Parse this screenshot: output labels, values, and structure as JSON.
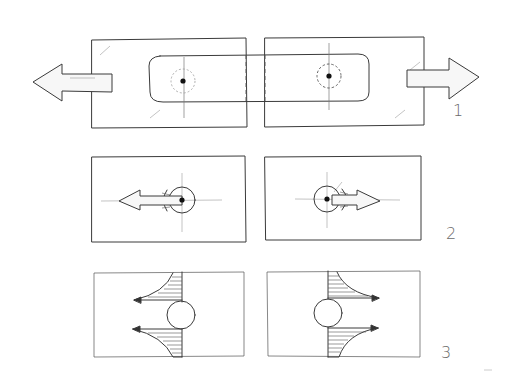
{
  "diagram": {
    "type": "hand-drawn mechanical sketch",
    "rows": [
      {
        "label": "1",
        "description": "Two plates joined by a rounded strap with two pins, pulled apart by opposing arrows"
      },
      {
        "label": "2",
        "description": "Pin in hole with bearing stress under opposite directional loads"
      },
      {
        "label": "3",
        "description": "Stress distribution at hole edges on both plates"
      }
    ]
  },
  "labels": {
    "row1": "1",
    "row2": "2",
    "row3": "3"
  },
  "colors": {
    "line": "#3a3a3a",
    "faint": "#9a9a9a",
    "pin": "#111111",
    "background": "#ffffff"
  }
}
